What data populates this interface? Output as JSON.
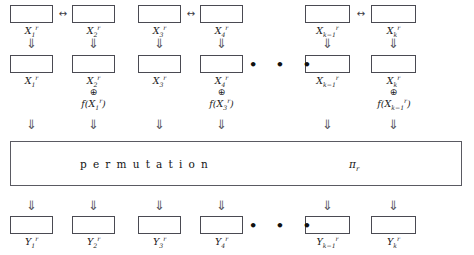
{
  "diagram": {
    "colors": {
      "box_border": "#4a4a52",
      "perm_border": "#5a5a62",
      "text": "#1b1b1b",
      "arrow": "#55555d",
      "background": "#ffffff"
    },
    "glyphs": {
      "down_arrow": "⇓",
      "swap_arrow": "↔",
      "xor": "⊕",
      "ellipsis": "• • •"
    },
    "permutation": {
      "label": "permutation",
      "symbol": "π",
      "symbol_subscript": "r"
    },
    "row_input": {
      "name": "input-registers",
      "cells": [
        {
          "id": "x1",
          "base": "X",
          "sub": "1",
          "sup": "r"
        },
        {
          "id": "x2",
          "base": "X",
          "sub": "2",
          "sup": "r"
        },
        {
          "id": "x3",
          "base": "X",
          "sub": "3",
          "sup": "r"
        },
        {
          "id": "x4",
          "base": "X",
          "sub": "4",
          "sup": "r"
        },
        {
          "id": "xkm1",
          "base": "X",
          "sub": "k−1",
          "sup": "r"
        },
        {
          "id": "xk",
          "base": "X",
          "sub": "k",
          "sup": "r"
        }
      ]
    },
    "row_mixed": {
      "name": "mixed-registers",
      "cells": [
        {
          "id": "x1m",
          "base": "X",
          "sub": "1",
          "sup": "r"
        },
        {
          "id": "x2m",
          "base": "X",
          "sub": "2",
          "sup": "r"
        },
        {
          "id": "x3m",
          "base": "X",
          "sub": "3",
          "sup": "r"
        },
        {
          "id": "x4m",
          "base": "X",
          "sub": "4",
          "sup": "r"
        },
        {
          "id": "xkm1m",
          "base": "X",
          "sub": "k−1",
          "sup": "r"
        },
        {
          "id": "xkm",
          "base": "X",
          "sub": "k",
          "sup": "r"
        }
      ],
      "feistel_terms": [
        {
          "id": "f1",
          "fn": "f",
          "arg_base": "X",
          "arg_sub": "1",
          "arg_sup": "r"
        },
        {
          "id": "f3",
          "fn": "f",
          "arg_base": "X",
          "arg_sub": "3",
          "arg_sup": "r"
        },
        {
          "id": "f5",
          "fn": "f",
          "arg_base": "X",
          "arg_sub": "k−1",
          "arg_sup": "r"
        }
      ]
    },
    "row_output": {
      "name": "output-registers",
      "cells": [
        {
          "id": "y1",
          "base": "Y",
          "sub": "1",
          "sup": "r"
        },
        {
          "id": "y2",
          "base": "Y",
          "sub": "2",
          "sup": "r"
        },
        {
          "id": "y3",
          "base": "Y",
          "sub": "3",
          "sup": "r"
        },
        {
          "id": "y4",
          "base": "Y",
          "sub": "4",
          "sup": "r"
        },
        {
          "id": "ykm1",
          "base": "Y",
          "sub": "k−1",
          "sup": "r"
        },
        {
          "id": "yk",
          "base": "Y",
          "sub": "k",
          "sup": "r"
        }
      ]
    }
  }
}
